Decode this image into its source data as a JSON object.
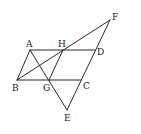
{
  "diagram": {
    "type": "geometry-figure",
    "points": {
      "A": {
        "label": "A",
        "x": 30,
        "y": 50
      },
      "H": {
        "label": "H",
        "x": 63,
        "y": 50
      },
      "D": {
        "label": "D",
        "x": 95,
        "y": 50
      },
      "B": {
        "label": "B",
        "x": 17,
        "y": 80
      },
      "G": {
        "label": "G",
        "x": 49,
        "y": 80
      },
      "C": {
        "label": "C",
        "x": 81,
        "y": 80
      },
      "F": {
        "label": "F",
        "x": 110,
        "y": 20
      },
      "E": {
        "label": "E",
        "x": 67,
        "y": 110
      }
    },
    "segments": [
      [
        "A",
        "D"
      ],
      [
        "B",
        "C"
      ],
      [
        "A",
        "B"
      ],
      [
        "H",
        "G"
      ],
      [
        "B",
        "F"
      ],
      [
        "A",
        "E"
      ],
      [
        "F",
        "E"
      ]
    ],
    "labels": {
      "A": "A",
      "H": "H",
      "D": "D",
      "B": "B",
      "G": "G",
      "C": "C",
      "F": "F",
      "E": "E"
    }
  }
}
